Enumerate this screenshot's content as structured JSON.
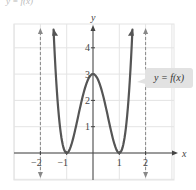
{
  "caption_cut": "y = f(x)",
  "callout": {
    "label": "y = f(x)"
  },
  "axes": {
    "x_label": "x",
    "y_label": "y"
  },
  "chart_data": {
    "type": "line",
    "title": "",
    "xlabel": "x",
    "ylabel": "y",
    "xlim": [
      -2.9,
      3.1
    ],
    "ylim": [
      -1,
      5
    ],
    "grid": true,
    "x_ticks": [
      -2,
      -1,
      1,
      2
    ],
    "x_tick_labels": [
      "−2",
      "−1",
      "1",
      "2"
    ],
    "y_ticks": [
      1,
      2,
      3,
      4
    ],
    "y_tick_labels": [
      "1",
      "2",
      "3",
      "4"
    ],
    "series": [
      {
        "name": "y = f(x)",
        "function": "3(x^2 - 1)^2",
        "x": [
          -1.5,
          -1.25,
          -1,
          -0.75,
          -0.5,
          0,
          0.5,
          0.75,
          1,
          1.25,
          1.5
        ],
        "y": [
          4.69,
          1.42,
          0,
          0.57,
          1.69,
          3,
          1.69,
          0.57,
          0,
          1.42,
          4.69
        ]
      }
    ],
    "asymptotes_dashed": [
      -2,
      2
    ],
    "annotations": [
      "y = f(x)"
    ]
  },
  "colors": {
    "curve": "#555555",
    "grid": "#e4e4e4",
    "axis": "#444444",
    "dashed": "#888888",
    "callout_bg": "#e2e2e2"
  }
}
